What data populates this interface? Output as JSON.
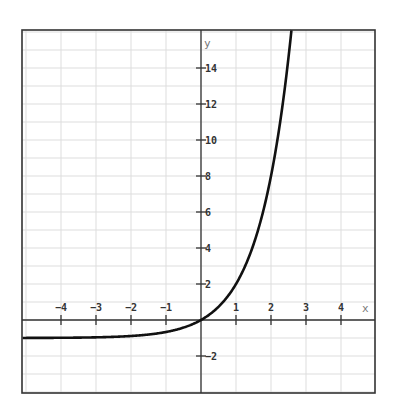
{
  "chart_data": {
    "type": "line",
    "title": "",
    "xlabel": "x",
    "ylabel": "y",
    "xlim": [
      -5.1,
      5.0
    ],
    "ylim": [
      -4.05,
      16.1
    ],
    "grid": true,
    "legend": null,
    "x_ticks": [
      -4,
      -3,
      -2,
      -1,
      1,
      2,
      3,
      4
    ],
    "x_tick_labels": [
      "−4",
      "−3",
      "−2",
      "−1",
      "1",
      "2",
      "3",
      "4"
    ],
    "y_ticks": [
      -2,
      2,
      4,
      6,
      8,
      10,
      12,
      14
    ],
    "y_tick_labels": [
      "−2",
      "2",
      "4",
      "6",
      "8",
      "10",
      "12",
      "14"
    ],
    "series": [
      {
        "name": "f(x) = 3^x − 1",
        "x": [
          -5,
          -4,
          -3,
          -2,
          -1,
          0,
          0.5,
          1,
          1.5,
          2,
          2.3,
          2.5
        ],
        "values": [
          -0.996,
          -0.988,
          -0.963,
          -0.889,
          -0.667,
          0,
          0.732,
          2,
          4.196,
          8,
          11.5,
          14.59
        ]
      }
    ],
    "asymptote_y": -1,
    "colors": {
      "curve": "#111111",
      "axes": "#333333",
      "grid": "#dddddd",
      "frame": "#333333"
    }
  }
}
